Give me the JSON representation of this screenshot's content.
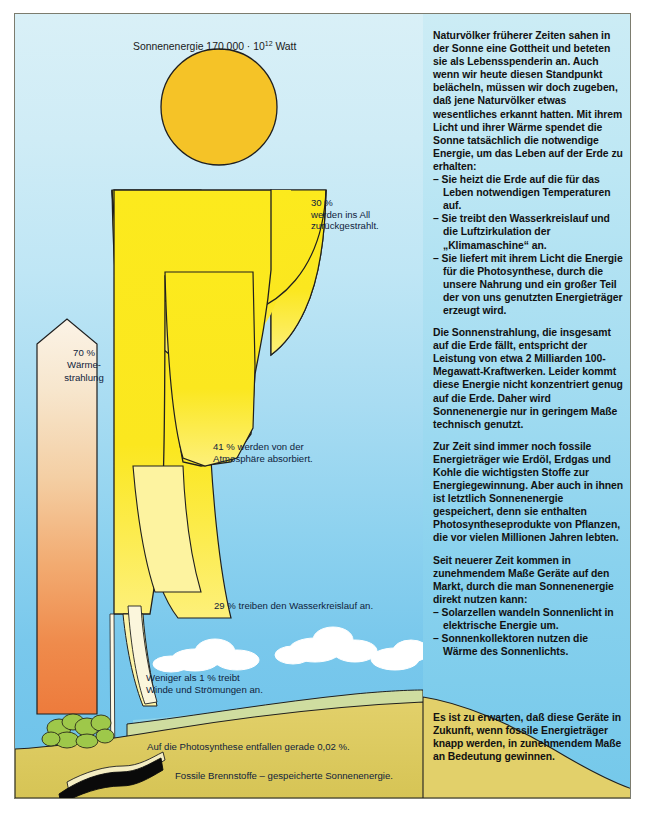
{
  "figure": {
    "title": "Sonnenenergie 170 000 · 10",
    "title_exponent": "12",
    "title_unit": " Watt",
    "labels": {
      "reflected": "30 %\nwerden ins All\nzurückgestrahlt.",
      "absorbed": "41 % werden von der\nAtmosphäre absorbiert.",
      "watercycle": "29 % treiben den Wasserkreislauf an.",
      "wind": "Weniger als 1 % treibt\nWinde und Strömungen an.",
      "photosynthesis": "Auf die Photosynthese entfallen gerade 0,02 %.",
      "fossil": "Fossile Brennstoffe – gespeicherte Sonnenenergie.",
      "heat": "70 %\nWärme-\nstrahlung"
    },
    "colors": {
      "sun": "#f5c327",
      "flow": "#fbe71f",
      "wind_stream": "#faf4d6",
      "sky_top": "#d9f0f7",
      "sky_bottom": "#6cc2ea",
      "ground": "#ddcc5e",
      "grass": "#c9d98a",
      "bush": "#9ec84a",
      "coal": "#0a0a0a",
      "heat_arrow_top": "#f6ead8",
      "heat_arrow_bottom": "#f08040",
      "cloud": "#ffffff",
      "outline": "#1a1a1a"
    }
  },
  "article": {
    "paragraphs": [
      "Naturvölker früherer Zeiten sahen in der Sonne eine Gottheit und beteten sie als Lebensspenderin an. Auch wenn wir heute diesen Standpunkt belächeln, müssen wir doch zugeben, daß jene Naturvölker etwas wesentliches erkannt hatten. Mit ihrem Licht und ihrer Wärme spendet die Sonne tatsächlich die notwendige Energie, um das Leben auf der Erde zu erhalten:"
    ],
    "list1": [
      "Sie heizt die Erde auf die für das Leben notwendigen Temperaturen auf.",
      "Sie treibt den Wasserkreislauf und die Luftzirkulation der „Klimamaschine“ an.",
      "Sie liefert mit ihrem Licht die Energie für die Photosynthese, durch die unsere Nahrung und ein großer Teil der von uns genutzten Energieträger erzeugt wird."
    ],
    "paragraph2": "Die Sonnenstrahlung, die insgesamt auf die Erde fällt, entspricht der Leistung von etwa 2 Milliarden 100-Megawatt-Kraftwerken. Leider kommt diese Energie nicht konzentriert genug auf die Erde. Daher wird Sonnenenergie nur in geringem Maße technisch genutzt.",
    "paragraph3": "Zur Zeit sind immer noch fossile Energieträger wie Erdöl, Erdgas und Kohle die wichtigsten Stoffe zur Energiegewinnung. Aber auch in ihnen ist letztlich Sonnenenergie gespeichert, denn sie enthalten Photosyntheseprodukte von Pflanzen, die vor vielen Millionen Jahren lebten.",
    "paragraph4": "Seit neuerer Zeit kommen in zunehmendem Maße Geräte auf den Markt, durch die man Sonnenenergie direkt nutzen kann:",
    "list2": [
      "Solarzellen wandeln Sonnenlicht in elektrische Energie um.",
      "Sonnenkollektoren nutzen die Wärme des Sonnenlichts."
    ],
    "paragraph5": "Es ist zu erwarten, daß diese Geräte in Zukunft, wenn fossile Energieträger knapp werden, in zunehmendem Maße an Bedeutung gewinnen."
  }
}
